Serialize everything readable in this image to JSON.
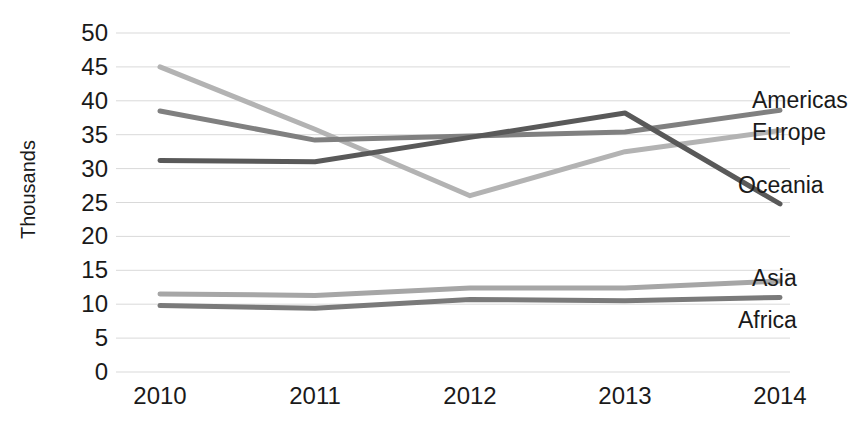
{
  "chart_data": {
    "type": "line",
    "title": "",
    "xlabel": "",
    "ylabel": "Thousands",
    "categories": [
      "2010",
      "2011",
      "2012",
      "2013",
      "2014"
    ],
    "ylim": [
      0,
      50
    ],
    "yticks": [
      0,
      5,
      10,
      15,
      20,
      25,
      30,
      35,
      40,
      45,
      50
    ],
    "grid": true,
    "legend_position": "right-inline-labels",
    "series": [
      {
        "name": "Americas",
        "color": "#808080",
        "values": [
          38.5,
          34.2,
          34.8,
          35.4,
          38.6
        ]
      },
      {
        "name": "Europe",
        "color": "#b3b3b3",
        "values": [
          45.0,
          35.8,
          26.0,
          32.5,
          35.6
        ]
      },
      {
        "name": "Oceania",
        "color": "#595959",
        "values": [
          31.2,
          31.0,
          34.6,
          38.2,
          24.8
        ]
      },
      {
        "name": "Asia",
        "color": "#a6a6a6",
        "values": [
          11.5,
          11.3,
          12.4,
          12.4,
          13.4
        ]
      },
      {
        "name": "Africa",
        "color": "#7a7a7a",
        "values": [
          9.8,
          9.4,
          10.7,
          10.5,
          11.0
        ]
      }
    ]
  },
  "axis": {
    "y_title": "Thousands",
    "y_tick_labels": [
      "50",
      "45",
      "40",
      "35",
      "30",
      "25",
      "20",
      "15",
      "10",
      "5",
      "0"
    ],
    "x_tick_labels": [
      "2010",
      "2011",
      "2012",
      "2013",
      "2014"
    ]
  },
  "series_labels": [
    {
      "text": "Americas",
      "key": 0
    },
    {
      "text": "Europe",
      "key": 1
    },
    {
      "text": "Oceania",
      "key": 2
    },
    {
      "text": "Asia",
      "key": 3
    },
    {
      "text": "Africa",
      "key": 4
    }
  ],
  "style": {
    "gridline_color": "#d9d9d9",
    "text_color": "#1a1a1a",
    "background": "#ffffff",
    "line_width": 5
  }
}
